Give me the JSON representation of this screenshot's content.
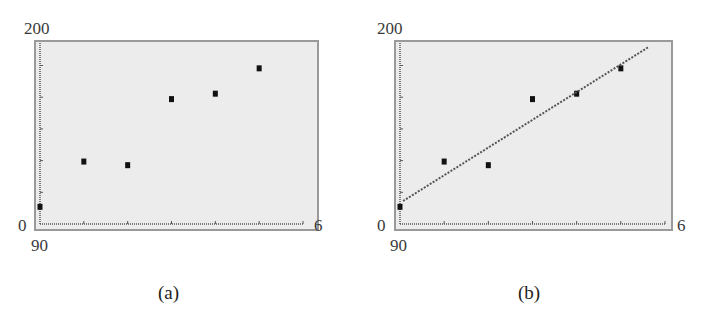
{
  "chart_data": [
    {
      "id": "a",
      "type": "scatter",
      "caption": "(a)",
      "title": "",
      "xlabel": "",
      "ylabel": "",
      "labels": {
        "ymax": "200",
        "ymin": "0",
        "xmax": "6",
        "xmin": "90"
      },
      "xlim": [
        0,
        6
      ],
      "ylim": [
        0,
        200
      ],
      "x_ticks": [
        0,
        1,
        2,
        3,
        4,
        5,
        6
      ],
      "grid": false,
      "legend": null,
      "series": [
        {
          "name": "data",
          "marker": "square",
          "x": [
            0,
            1,
            2,
            3,
            4,
            5
          ],
          "y": [
            19,
            69,
            65,
            138,
            144,
            172
          ]
        }
      ]
    },
    {
      "id": "b",
      "type": "scatter",
      "caption": "(b)",
      "title": "",
      "xlabel": "",
      "ylabel": "",
      "labels": {
        "ymax": "200",
        "ymin": "0",
        "xmax": "6",
        "xmin": "90"
      },
      "xlim": [
        0,
        6
      ],
      "ylim": [
        0,
        200
      ],
      "x_ticks": [
        0,
        1,
        2,
        3,
        4,
        5,
        6
      ],
      "grid": false,
      "legend": null,
      "series": [
        {
          "name": "data",
          "marker": "square",
          "x": [
            0,
            1,
            2,
            3,
            4,
            5
          ],
          "y": [
            19,
            69,
            65,
            138,
            144,
            172
          ]
        },
        {
          "name": "regression line",
          "style": "dotted-line",
          "x": [
            0.07,
            5.63
          ],
          "y": [
            25.4,
            195.6
          ],
          "slope": 30.4,
          "intercept": 25.3
        }
      ]
    }
  ],
  "panels": [
    {
      "caption": "(a)",
      "ymax_label": "200",
      "ymin_label": "0",
      "xmax_label": "6",
      "xmin_label": "90"
    },
    {
      "caption": "(b)",
      "ymax_label": "200",
      "ymin_label": "0",
      "xmax_label": "6",
      "xmin_label": "90"
    }
  ],
  "colors": {
    "plot_background": "#ececec",
    "frame": "#9a9a9a",
    "axis": "#555555",
    "point": "#111111",
    "line": "#555555"
  }
}
